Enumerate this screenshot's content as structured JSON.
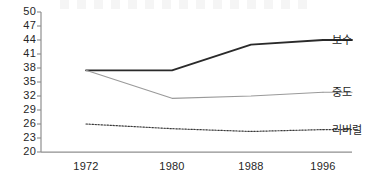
{
  "chart_data": {
    "type": "line",
    "title": "",
    "xlabel": "",
    "ylabel": "",
    "categories": [
      "1972",
      "1980",
      "1988",
      "1996"
    ],
    "x": [
      1972,
      1980,
      1988,
      1996
    ],
    "ylim": [
      20,
      50
    ],
    "yticks": [
      50,
      47,
      44,
      41,
      38,
      35,
      32,
      29,
      26,
      23,
      20
    ],
    "grid": false,
    "legend_position": "right-inline",
    "series": [
      {
        "name": "보수",
        "values": [
          37.5,
          37.5,
          43.0,
          44.0
        ],
        "style": "solid-thick",
        "color": "#2a2a2a"
      },
      {
        "name": "중도",
        "values": [
          37.5,
          31.5,
          32.0,
          32.8
        ],
        "style": "solid-thin",
        "color": "#9a9a9a"
      },
      {
        "name": "리버럴",
        "values": [
          26.0,
          25.0,
          24.4,
          24.8
        ],
        "style": "dotted",
        "color": "#3a3a3a"
      }
    ]
  },
  "axes": {
    "y_tick_labels": [
      "50",
      "47",
      "44",
      "41",
      "38",
      "35",
      "32",
      "29",
      "26",
      "23",
      "20"
    ],
    "x_tick_labels": [
      "1972",
      "1980",
      "1988",
      "1996"
    ]
  },
  "legend": {
    "items": [
      {
        "label": "보수",
        "marker": "solid-thick-line"
      },
      {
        "label": "중도",
        "marker": "solid-thin-line"
      },
      {
        "label": "리버럴",
        "marker": "dotted-line"
      }
    ]
  },
  "colors": {
    "conservative": "#2a2a2a",
    "moderate": "#9a9a9a",
    "liberal": "#3a3a3a",
    "axis": "#8a8a8a",
    "text": "#262626",
    "background": "#ffffff"
  }
}
